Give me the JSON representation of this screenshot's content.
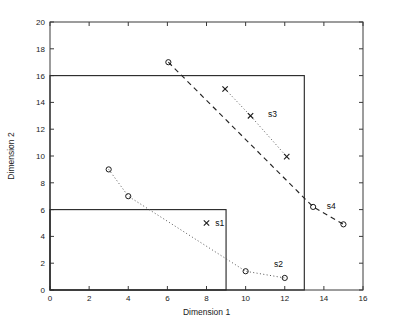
{
  "chart_data": {
    "type": "scatter",
    "title": "",
    "xlabel": "Dimension 1",
    "ylabel": "Dimension 2",
    "xlim": [
      0,
      16
    ],
    "ylim": [
      0,
      20
    ],
    "xticks": [
      0,
      2,
      4,
      6,
      8,
      10,
      12,
      14,
      16
    ],
    "yticks": [
      0,
      2,
      4,
      6,
      8,
      10,
      12,
      14,
      16,
      18,
      20
    ],
    "xtick_labels": [
      "0",
      "2",
      "4",
      "6",
      "8",
      "10",
      "12",
      "14",
      "16"
    ],
    "ytick_labels": [
      "0",
      "2",
      "4",
      "6",
      "8",
      "10",
      "12",
      "14",
      "16",
      "18",
      "20"
    ],
    "grid": false,
    "legend_position": "inline-annotations",
    "regions": [
      {
        "name": "outer-region",
        "x0": 0,
        "y0": 0,
        "x1": 13,
        "y1": 16
      },
      {
        "name": "inner-region",
        "x0": 0,
        "y0": 0,
        "x1": 9,
        "y1": 6
      }
    ],
    "series": [
      {
        "name": "s1",
        "label": "s1",
        "marker": "x",
        "line": "none",
        "label_x": 8.45,
        "label_y": 5.0,
        "points": [
          {
            "x": 8.0,
            "y": 5.0
          }
        ]
      },
      {
        "name": "s2",
        "label": "s2",
        "marker": "o",
        "line": "dotted",
        "label_x": 11.45,
        "label_y": 1.95,
        "points": [
          {
            "x": 3.0,
            "y": 9.0
          },
          {
            "x": 4.0,
            "y": 7.0
          },
          {
            "x": 10.0,
            "y": 1.4
          },
          {
            "x": 12.0,
            "y": 0.9
          }
        ]
      },
      {
        "name": "s3",
        "label": "s3",
        "marker": "x",
        "line": "dotted",
        "label_x": 11.15,
        "label_y": 13.1,
        "points": [
          {
            "x": 8.95,
            "y": 15.0
          },
          {
            "x": 10.25,
            "y": 13.0
          },
          {
            "x": 12.1,
            "y": 9.95
          }
        ]
      },
      {
        "name": "s4",
        "label": "s4",
        "marker": "o",
        "line": "dashed",
        "label_x": 14.15,
        "label_y": 6.3,
        "points": [
          {
            "x": 6.05,
            "y": 17.0
          },
          {
            "x": 13.45,
            "y": 6.2
          },
          {
            "x": 15.0,
            "y": 4.9
          }
        ]
      }
    ],
    "colors": {
      "axis": "#3a3a3a",
      "region_stroke": "#2b2b2b",
      "marker": "#1a1a1a",
      "dashed_line": "#242424",
      "dotted_line": "#555555",
      "background": "#ffffff"
    }
  }
}
